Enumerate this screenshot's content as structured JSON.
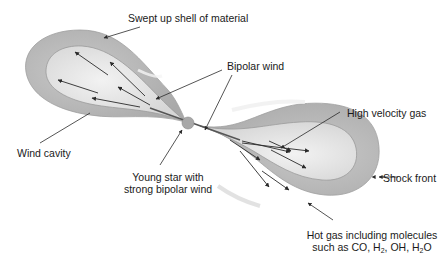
{
  "labels": {
    "swept_shell": "Swept up shell of material",
    "bipolar_wind": "Bipolar wind",
    "high_velocity_gas": "High velocity gas",
    "wind_cavity": "Wind cavity",
    "young_star_line1": "Young star with",
    "young_star_line2": "strong bipolar wind",
    "shock_front": "Shock front",
    "hot_gas_line1": "Hot gas including molecules",
    "hot_gas_line2_prefix": "such as CO, H",
    "hot_gas_h2_sub": "2",
    "hot_gas_mid": ", OH, H",
    "hot_gas_h2o_sub": "2",
    "hot_gas_suffix": "O"
  },
  "colors": {
    "shell": "#b9b9b9",
    "shell_edge": "#9a9a9a",
    "cavity": "#e4e4e4",
    "star": "#a8a8a8",
    "arrow": "#2a2a2a",
    "text": "#1a1a1a"
  }
}
